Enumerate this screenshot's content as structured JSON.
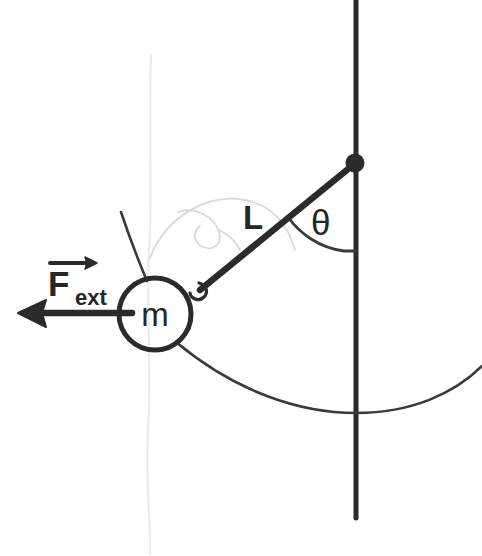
{
  "figure": {
    "medium": "hand-drawn pencil sketch",
    "background_color": "#ffffff",
    "ink_color": "#2b2b2b",
    "ghost_color": "#d9d9dc",
    "width": 482,
    "height": 556
  },
  "labels": {
    "force_symbol": "F",
    "force_subscript": "ext",
    "force_vector_accent": "arrow-overbar",
    "length_symbol": "L",
    "angle_symbol": "θ",
    "mass_symbol": "m"
  },
  "geometry": {
    "pivot": {
      "x": 355,
      "y": 163,
      "dot_radius": 9
    },
    "mass": {
      "cx": 155,
      "cy": 314,
      "r": 36,
      "stroke_width": 5
    },
    "vertical_line": {
      "x": 356,
      "y_top": 0,
      "y_bottom": 518,
      "stroke_width": 5
    },
    "string": {
      "x1": 355,
      "y1": 163,
      "x2": 196,
      "y2": 292,
      "stroke_width": 6
    },
    "connector_loop": {
      "cx": 198,
      "cy": 291,
      "r": 6
    },
    "angle_arc": {
      "center_x": 355,
      "center_y": 163,
      "radius": 88,
      "start_deg": 0,
      "end_deg": 39
    },
    "swing_arc": {
      "from_x": 176,
      "from_y": 342,
      "low_x": 356,
      "low_y": 413,
      "to_x": 482,
      "to_y": 368
    },
    "force_arrow": {
      "tail_x": 128,
      "tail_y": 313,
      "tip_x": 18,
      "tip_y": 313,
      "stroke_width": 6,
      "head_length": 26,
      "head_half_width": 13
    },
    "alt_string_stroke": {
      "x1": 122,
      "y1": 213,
      "x2": 148,
      "y2": 280
    }
  },
  "label_positions": {
    "force": {
      "x": 48,
      "y": 296
    },
    "force_sub": {
      "x": 76,
      "y": 304
    },
    "force_bar": {
      "x1": 50,
      "y1": 262,
      "x2": 93,
      "y2": 262
    },
    "length": {
      "x": 243,
      "y": 229
    },
    "angle": {
      "x": 310,
      "y": 235
    },
    "mass": {
      "x": 142,
      "y": 327
    }
  },
  "ghost_marks": {
    "erased_vertical_x": 150,
    "erased_arc_note": "faint erased arc and swirl behind the string region"
  }
}
